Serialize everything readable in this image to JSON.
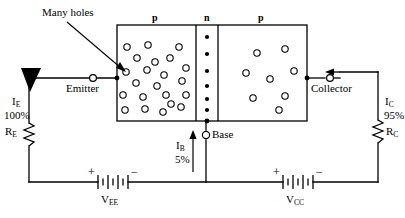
{
  "figure": {
    "type": "circuit-diagram",
    "stroke_color": "#000000",
    "background_color": "#ffffff"
  },
  "annotations": {
    "many_holes": "Many holes"
  },
  "semiconductor": {
    "regions": [
      {
        "name": "emitter-region",
        "label": "p",
        "carriers": "holes",
        "carrier_count": 22
      },
      {
        "name": "base-region",
        "label": "n",
        "carriers": "electrons",
        "carrier_count": 7
      },
      {
        "name": "collector-region",
        "label": "p",
        "carriers": "holes",
        "carrier_count": 8
      }
    ]
  },
  "terminals": {
    "emitter": "Emitter",
    "base": "Base",
    "collector": "Collector"
  },
  "currents": {
    "emitter": {
      "symbol": "I",
      "subscript": "E",
      "percent": "100%"
    },
    "base": {
      "symbol": "I",
      "subscript": "B",
      "percent": "5%"
    },
    "collector": {
      "symbol": "I",
      "subscript": "C",
      "percent": "95%"
    }
  },
  "resistors": [
    {
      "symbol": "R",
      "subscript": "E",
      "name": "emitter-resistor"
    },
    {
      "symbol": "R",
      "subscript": "C",
      "name": "collector-resistor"
    }
  ],
  "sources": [
    {
      "symbol": "V",
      "subscript": "EE",
      "name": "emitter-supply",
      "plus": "+",
      "minus": "−"
    },
    {
      "symbol": "V",
      "subscript": "CC",
      "name": "collector-supply",
      "plus": "+",
      "minus": "−"
    }
  ]
}
